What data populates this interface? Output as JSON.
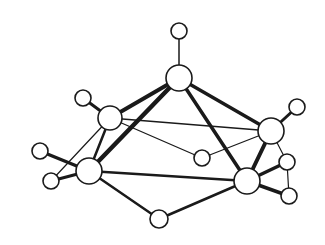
{
  "diagram": {
    "type": "ball-and-stick molecular structure",
    "colors": {
      "line": "#1a1a1a",
      "atom_fill": "#ffffff",
      "background": "#ffffff"
    },
    "atoms": [
      {
        "id": "H_top",
        "x": 179,
        "y": 31,
        "r": 8
      },
      {
        "id": "B_apex",
        "x": 179,
        "y": 78,
        "r": 13
      },
      {
        "id": "B_left_upper",
        "x": 110,
        "y": 118,
        "r": 12
      },
      {
        "id": "H_left_upper",
        "x": 83,
        "y": 98,
        "r": 8
      },
      {
        "id": "B_right_upper",
        "x": 271,
        "y": 131,
        "r": 13
      },
      {
        "id": "H_right_upper",
        "x": 297,
        "y": 107,
        "r": 8
      },
      {
        "id": "B_left_lower",
        "x": 89,
        "y": 171,
        "r": 13
      },
      {
        "id": "H_left_lower_a",
        "x": 40,
        "y": 151,
        "r": 8
      },
      {
        "id": "H_left_lower_b",
        "x": 51,
        "y": 181,
        "r": 8
      },
      {
        "id": "B_right_lower",
        "x": 247,
        "y": 181,
        "r": 13
      },
      {
        "id": "H_right_lower_a",
        "x": 287,
        "y": 162,
        "r": 8
      },
      {
        "id": "H_right_lower_b",
        "x": 289,
        "y": 196,
        "r": 8
      },
      {
        "id": "H_back",
        "x": 202,
        "y": 158,
        "r": 8
      },
      {
        "id": "H_bottom_bridge",
        "x": 159,
        "y": 219,
        "r": 9
      }
    ],
    "bonds": [
      {
        "a": "H_top",
        "b": "B_apex",
        "w": 1.5
      },
      {
        "a": "B_apex",
        "b": "B_left_upper",
        "w": 4
      },
      {
        "a": "B_apex",
        "b": "B_left_lower",
        "w": 4.5
      },
      {
        "a": "B_apex",
        "b": "B_right_upper",
        "w": 3.5
      },
      {
        "a": "B_apex",
        "b": "B_right_lower",
        "w": 3.5
      },
      {
        "a": "B_left_upper",
        "b": "H_left_upper",
        "w": 3
      },
      {
        "a": "B_left_upper",
        "b": "B_left_lower",
        "w": 2.5
      },
      {
        "a": "B_left_upper",
        "b": "B_right_upper",
        "w": 1.3
      },
      {
        "a": "B_left_upper",
        "b": "H_back",
        "w": 1.3
      },
      {
        "a": "B_left_upper",
        "b": "H_left_lower_b",
        "w": 1.2
      },
      {
        "a": "B_right_upper",
        "b": "H_right_upper",
        "w": 3
      },
      {
        "a": "B_right_upper",
        "b": "B_right_lower",
        "w": 4
      },
      {
        "a": "B_right_upper",
        "b": "H_back",
        "w": 1.3
      },
      {
        "a": "B_right_upper",
        "b": "H_right_lower_a",
        "w": 1.2
      },
      {
        "a": "B_left_lower",
        "b": "H_left_lower_a",
        "w": 3.5
      },
      {
        "a": "B_left_lower",
        "b": "H_left_lower_b",
        "w": 3
      },
      {
        "a": "B_left_lower",
        "b": "B_right_lower",
        "w": 2.5
      },
      {
        "a": "B_left_lower",
        "b": "H_bottom_bridge",
        "w": 2.5
      },
      {
        "a": "B_right_lower",
        "b": "H_bottom_bridge",
        "w": 2.5
      },
      {
        "a": "B_right_lower",
        "b": "H_right_lower_a",
        "w": 3.5
      },
      {
        "a": "B_right_lower",
        "b": "H_right_lower_b",
        "w": 3.5
      },
      {
        "a": "H_right_lower_a",
        "b": "H_right_lower_b",
        "w": 1.2
      }
    ]
  }
}
